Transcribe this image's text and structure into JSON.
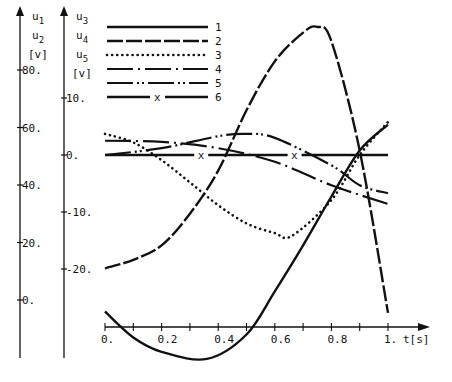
{
  "chart_data": {
    "type": "line",
    "title": "",
    "xlabel": "t[s]",
    "x_ticks": [
      "0.",
      "0.2",
      "0.4",
      "0.6",
      "0.8",
      "1."
    ],
    "xlim": [
      0,
      1.05
    ],
    "grid": false,
    "axes": [
      {
        "id": "left-1",
        "labels": [
          "u1",
          "u2",
          "[v]"
        ],
        "ticks": [
          "80.",
          "60.",
          "40.",
          "20.",
          "0."
        ],
        "tick_values": [
          80,
          60,
          40,
          20,
          0
        ],
        "series": [
          "1",
          "2"
        ]
      },
      {
        "id": "left-2",
        "labels": [
          "u3",
          "u4",
          "u5",
          "[v]"
        ],
        "ticks": [
          "10.",
          "0.",
          "-10.",
          "-20."
        ],
        "tick_values": [
          10,
          0,
          -10,
          -20
        ],
        "series": [
          "3",
          "4",
          "5",
          "6"
        ]
      }
    ],
    "legend": {
      "position": "top-left-inside",
      "entries": [
        {
          "label": "1",
          "style": "solid"
        },
        {
          "label": "2",
          "style": "long-dash"
        },
        {
          "label": "3",
          "style": "dotted"
        },
        {
          "label": "4",
          "style": "dash-dot"
        },
        {
          "label": "5",
          "style": "dash-dot-dot"
        },
        {
          "label": "6",
          "style": "solid-with-x-marker",
          "marker": "x"
        }
      ]
    },
    "series": [
      {
        "name": "1",
        "axis": "left-1",
        "style": "solid",
        "x": [
          0,
          0.1,
          0.2,
          0.36,
          0.5,
          0.6,
          0.7,
          0.8,
          0.9,
          1.0
        ],
        "values": [
          -4,
          -13,
          -18,
          -20.5,
          -12,
          3,
          19,
          36,
          52,
          61
        ]
      },
      {
        "name": "2",
        "axis": "left-1",
        "style": "long-dash",
        "x": [
          0,
          0.1,
          0.2,
          0.3,
          0.4,
          0.5,
          0.6,
          0.7,
          0.75,
          0.8,
          0.9,
          1.0
        ],
        "values": [
          11,
          14,
          19,
          30,
          45,
          66,
          83,
          93,
          95,
          90,
          52,
          -4.5
        ]
      },
      {
        "name": "3",
        "axis": "left-2",
        "style": "dotted",
        "x": [
          0,
          0.1,
          0.2,
          0.3,
          0.4,
          0.5,
          0.6,
          0.66,
          0.8,
          0.9,
          1.0
        ],
        "values": [
          3.7,
          2.2,
          -0.9,
          -4.8,
          -8.8,
          -12,
          -13.7,
          -14.2,
          -7.9,
          0,
          5.8
        ]
      },
      {
        "name": "4",
        "axis": "left-2",
        "style": "dash-dot",
        "x": [
          0,
          0.2,
          0.4,
          0.6,
          0.8,
          1.0
        ],
        "values": [
          2.5,
          2.3,
          1.2,
          -1.2,
          -5.3,
          -8.6
        ]
      },
      {
        "name": "5",
        "axis": "left-2",
        "style": "dash-dot-dot",
        "x": [
          0,
          0.2,
          0.4,
          0.5,
          0.6,
          0.8,
          0.9,
          1.0
        ],
        "values": [
          0,
          1.2,
          3.3,
          3.7,
          3.0,
          -1.8,
          -5.3,
          -6.7
        ]
      },
      {
        "name": "6",
        "axis": "left-2",
        "style": "solid-with-x-marker",
        "x": [
          0,
          1.0
        ],
        "values": [
          0,
          0
        ],
        "marker_x": [
          0.34,
          0.67
        ]
      }
    ]
  }
}
